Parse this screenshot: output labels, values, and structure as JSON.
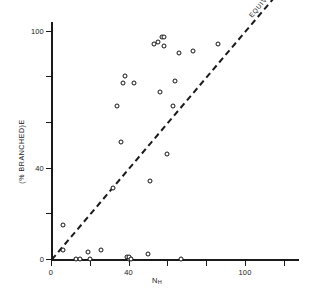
{
  "chart_data": {
    "type": "scatter",
    "title": "",
    "xlabel": "N_H",
    "xlabel_main": "N",
    "xlabel_sub": "H",
    "ylabel": "(% BRANCHED)E",
    "xlim": [
      0,
      128
    ],
    "ylim": [
      -4,
      104
    ],
    "grid": false,
    "legend_position": "none",
    "xticks": [
      0,
      20,
      40,
      60,
      80,
      100,
      120
    ],
    "xticklabels": [
      "0",
      "",
      "40",
      "",
      "",
      "100",
      ""
    ],
    "yticks": [
      0,
      20,
      40,
      60,
      80,
      100
    ],
    "yticklabels": [
      "0",
      "",
      "40",
      "",
      "",
      "100"
    ],
    "annotations": [
      {
        "text": "EQUIVALENCE",
        "kind": "line-label",
        "rotation": -30
      }
    ],
    "series": [
      {
        "name": "equivalence",
        "type": "line",
        "style": "dashed",
        "x": [
          0,
          128
        ],
        "y": [
          0,
          128
        ]
      },
      {
        "name": "samples",
        "type": "scatter",
        "marker": "open-circle",
        "points": [
          {
            "x": 6,
            "y": 15
          },
          {
            "x": 6,
            "y": 4
          },
          {
            "x": 13,
            "y": 0
          },
          {
            "x": 15,
            "y": 0
          },
          {
            "x": 19,
            "y": 3
          },
          {
            "x": 20,
            "y": 0
          },
          {
            "x": 26,
            "y": 4
          },
          {
            "x": 32,
            "y": 31
          },
          {
            "x": 34,
            "y": 67
          },
          {
            "x": 36,
            "y": 51
          },
          {
            "x": 37,
            "y": 77
          },
          {
            "x": 38,
            "y": 80
          },
          {
            "x": 39,
            "y": 1
          },
          {
            "x": 40,
            "y": 0
          },
          {
            "x": 40,
            "y": 1
          },
          {
            "x": 41,
            "y": 0
          },
          {
            "x": 43,
            "y": 77
          },
          {
            "x": 50,
            "y": 2
          },
          {
            "x": 51,
            "y": 34
          },
          {
            "x": 53,
            "y": 94
          },
          {
            "x": 55,
            "y": 95
          },
          {
            "x": 56,
            "y": 73
          },
          {
            "x": 57,
            "y": 97
          },
          {
            "x": 58,
            "y": 97
          },
          {
            "x": 58,
            "y": 93
          },
          {
            "x": 60,
            "y": 46
          },
          {
            "x": 63,
            "y": 67
          },
          {
            "x": 64,
            "y": 78
          },
          {
            "x": 66,
            "y": 90
          },
          {
            "x": 67,
            "y": 0
          },
          {
            "x": 73,
            "y": 91
          },
          {
            "x": 86,
            "y": 94
          }
        ]
      }
    ]
  }
}
